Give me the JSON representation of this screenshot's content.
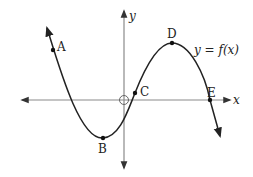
{
  "diagram": {
    "axes": {
      "x_label": "x",
      "y_label": "y",
      "origin_marker": "open-circle"
    },
    "curve_label": "y = f(x)",
    "points": [
      {
        "name": "A",
        "label": "A"
      },
      {
        "name": "B",
        "label": "B"
      },
      {
        "name": "C",
        "label": "C"
      },
      {
        "name": "D",
        "label": "D"
      },
      {
        "name": "E",
        "label": "E"
      }
    ],
    "colors": {
      "axis": "#888888",
      "curve": "#222222",
      "text": "#222222"
    }
  }
}
